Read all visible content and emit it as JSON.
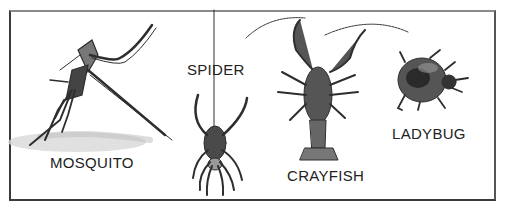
{
  "figure": {
    "creatures": [
      {
        "id": "mosquito",
        "label": "MOSQUITO"
      },
      {
        "id": "spider",
        "label": "SPIDER"
      },
      {
        "id": "crayfish",
        "label": "CRAYFISH"
      },
      {
        "id": "ladybug",
        "label": "LADYBUG"
      }
    ]
  },
  "colors": {
    "ink": "#2a2a2a",
    "border": "#3a3a3a",
    "background": "#ffffff"
  }
}
